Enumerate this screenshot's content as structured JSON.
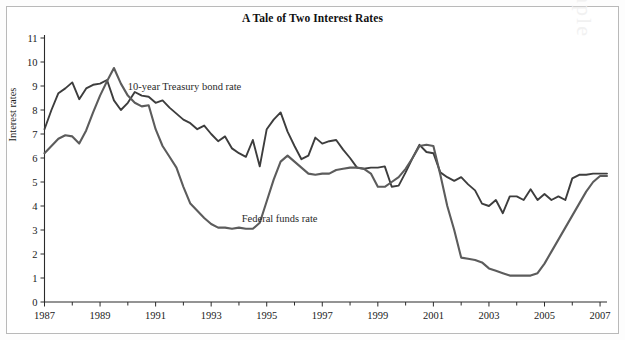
{
  "chart_data": {
    "type": "line",
    "title": "A Tale of Two Interest Rates",
    "xlabel": "",
    "ylabel": "Interest rates",
    "xlim": [
      1987,
      2007.25
    ],
    "ylim": [
      0,
      11
    ],
    "grid": false,
    "legend_position": "inline-annotations",
    "y_ticks": [
      0,
      1,
      2,
      3,
      4,
      5,
      6,
      7,
      8,
      9,
      10,
      11
    ],
    "x_ticks": [
      1987,
      1989,
      1991,
      1993,
      1995,
      1997,
      1999,
      2001,
      2003,
      2005,
      2007
    ],
    "x_minor_ticks": [
      1988,
      1990,
      1992,
      1994,
      1996,
      1998,
      2000,
      2002,
      2004,
      2006
    ],
    "x_tick_labels": [
      "1987",
      "1989",
      "1991",
      "1993",
      "1995",
      "1997",
      "1999",
      "2001",
      "2003",
      "2005",
      "2007"
    ],
    "y_tick_labels": [
      "0",
      "1",
      "2",
      "3",
      "4",
      "5",
      "6",
      "7",
      "8",
      "9",
      "10",
      "11"
    ],
    "annotations": [
      {
        "text": "10-year Treasury bond rate",
        "x": 1990.0,
        "y": 8.85
      },
      {
        "text": "Federal funds rate",
        "x": 1994.1,
        "y": 3.35
      }
    ],
    "series": [
      {
        "name": "10-year Treasury bond rate",
        "color": "#3d3d3d",
        "x": [
          1987.0,
          1987.25,
          1987.5,
          1987.75,
          1988.0,
          1988.25,
          1988.5,
          1988.75,
          1989.0,
          1989.25,
          1989.5,
          1989.75,
          1990.0,
          1990.25,
          1990.5,
          1990.75,
          1991.0,
          1991.25,
          1991.5,
          1991.75,
          1992.0,
          1992.25,
          1992.5,
          1992.75,
          1993.0,
          1993.25,
          1993.5,
          1993.75,
          1994.0,
          1994.25,
          1994.5,
          1994.75,
          1995.0,
          1995.25,
          1995.5,
          1995.75,
          1996.0,
          1996.25,
          1996.5,
          1996.75,
          1997.0,
          1997.25,
          1997.5,
          1997.75,
          1998.0,
          1998.25,
          1998.5,
          1998.75,
          1999.0,
          1999.25,
          1999.5,
          1999.75,
          2000.0,
          2000.25,
          2000.5,
          2000.75,
          2001.0,
          2001.25,
          2001.5,
          2001.75,
          2002.0,
          2002.25,
          2002.5,
          2002.75,
          2003.0,
          2003.25,
          2003.5,
          2003.75,
          2004.0,
          2004.25,
          2004.5,
          2004.75,
          2005.0,
          2005.25,
          2005.5,
          2005.75,
          2006.0,
          2006.25,
          2006.5,
          2006.75,
          2007.0,
          2007.25
        ],
        "y": [
          7.2,
          8.0,
          8.7,
          8.9,
          9.15,
          8.45,
          8.9,
          9.05,
          9.1,
          9.25,
          8.4,
          8.0,
          8.3,
          8.75,
          8.6,
          8.55,
          8.3,
          8.4,
          8.1,
          7.85,
          7.6,
          7.45,
          7.2,
          7.35,
          7.0,
          6.7,
          6.9,
          6.4,
          6.2,
          6.05,
          6.75,
          5.65,
          7.2,
          7.6,
          7.9,
          7.1,
          6.5,
          5.95,
          6.1,
          6.85,
          6.6,
          6.7,
          6.75,
          6.35,
          6.0,
          5.6,
          5.55,
          5.6,
          5.6,
          5.65,
          4.8,
          4.85,
          5.4,
          6.0,
          6.55,
          6.25,
          6.2,
          5.4,
          5.2,
          5.05,
          5.2,
          4.9,
          4.65,
          4.1,
          4.0,
          4.25,
          3.7,
          4.4,
          4.4,
          4.25,
          4.7,
          4.25,
          4.5,
          4.25,
          4.4,
          4.25,
          5.15,
          5.3,
          5.3,
          5.35,
          5.35,
          5.35
        ]
      },
      {
        "name": "Federal funds rate",
        "color": "#5c5c5c",
        "x": [
          1987.0,
          1987.25,
          1987.5,
          1987.75,
          1988.0,
          1988.25,
          1988.5,
          1988.75,
          1989.0,
          1989.25,
          1989.5,
          1989.75,
          1990.0,
          1990.25,
          1990.5,
          1990.75,
          1991.0,
          1991.25,
          1991.5,
          1991.75,
          1992.0,
          1992.25,
          1992.5,
          1992.75,
          1993.0,
          1993.25,
          1993.5,
          1993.75,
          1994.0,
          1994.25,
          1994.5,
          1994.75,
          1995.0,
          1995.25,
          1995.5,
          1995.75,
          1996.0,
          1996.25,
          1996.5,
          1996.75,
          1997.0,
          1997.25,
          1997.5,
          1997.75,
          1998.0,
          1998.25,
          1998.5,
          1998.75,
          1999.0,
          1999.25,
          1999.5,
          1999.75,
          2000.0,
          2000.25,
          2000.5,
          2000.75,
          2001.0,
          2001.25,
          2001.5,
          2001.75,
          2002.0,
          2002.25,
          2002.5,
          2002.75,
          2003.0,
          2003.25,
          2003.5,
          2003.75,
          2004.0,
          2004.25,
          2004.5,
          2004.75,
          2005.0,
          2005.25,
          2005.5,
          2005.75,
          2006.0,
          2006.25,
          2006.5,
          2006.75,
          2007.0,
          2007.25
        ],
        "y": [
          6.2,
          6.5,
          6.8,
          6.95,
          6.9,
          6.6,
          7.15,
          7.9,
          8.6,
          9.2,
          9.75,
          9.1,
          8.6,
          8.3,
          8.15,
          8.2,
          7.2,
          6.5,
          6.05,
          5.6,
          4.8,
          4.1,
          3.8,
          3.5,
          3.25,
          3.1,
          3.1,
          3.05,
          3.1,
          3.05,
          3.05,
          3.3,
          4.2,
          5.1,
          5.85,
          6.1,
          5.85,
          5.6,
          5.35,
          5.3,
          5.35,
          5.35,
          5.5,
          5.55,
          5.6,
          5.6,
          5.55,
          5.35,
          4.8,
          4.8,
          5.0,
          5.2,
          5.55,
          6.0,
          6.5,
          6.55,
          6.5,
          5.3,
          4.0,
          3.0,
          1.85,
          1.8,
          1.75,
          1.65,
          1.4,
          1.3,
          1.2,
          1.1,
          1.1,
          1.1,
          1.1,
          1.2,
          1.6,
          2.1,
          2.6,
          3.1,
          3.6,
          4.1,
          4.6,
          5.0,
          5.25,
          5.25
        ]
      }
    ]
  },
  "watermark": {
    "text": "Sample"
  }
}
